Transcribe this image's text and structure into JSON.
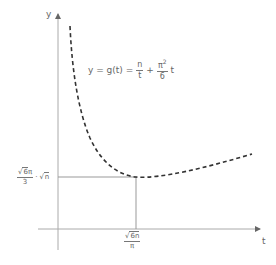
{
  "diagram": {
    "type": "function-plot",
    "colors": {
      "axis": "#aaaaaa",
      "curve": "#333333",
      "guide": "#999999",
      "text": "#666666"
    },
    "axes": {
      "x_label": "t",
      "y_label": "y"
    },
    "formula": {
      "lhs": "y = g(t) =",
      "term1_num": "n",
      "term1_den": "t",
      "plus": "+",
      "term2_num": "π",
      "term2_exp": "2",
      "term2_den": "6",
      "term2_var": "t"
    },
    "minimum_point": {
      "x_label_num_root": "6n",
      "x_label_den": "π",
      "y_label_num_prefix": "√",
      "y_label_num_root": "6",
      "y_label_num_suffix": "π",
      "y_label_den": "3",
      "y_label_dot": "·",
      "y_label_root": "n"
    },
    "curve_style": "dashed"
  }
}
